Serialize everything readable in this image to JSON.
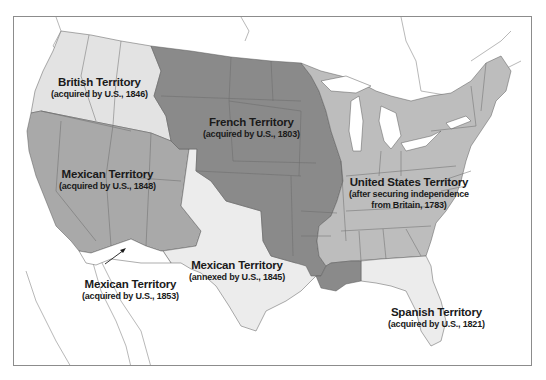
{
  "map": {
    "title": "Territorial acquisitions of the United States",
    "colors": {
      "background": "#ffffff",
      "frame": "#8c8c8c",
      "british": "#e3e3e3",
      "mexican_1848": "#a9a9a9",
      "french": "#8a8a8a",
      "united_states": "#bdbdbd",
      "texas": "#ececec",
      "spanish": "#ececec",
      "gadsden": "#ffffff",
      "borders": "#5a5a5a",
      "water_lines": "#9a9a9a"
    },
    "regions": [
      {
        "id": "british",
        "title": "British Territory",
        "subtitle": "(acquired by U.S., 1846)"
      },
      {
        "id": "french",
        "title": "French Territory",
        "subtitle": "(acquired by U.S., 1803)"
      },
      {
        "id": "mexican-1848",
        "title": "Mexican Territory",
        "subtitle": "(acquired by U.S., 1848)"
      },
      {
        "id": "united-states",
        "title": "United States Territory",
        "subtitle": "(after securing independence",
        "subtitle2": "from Britain, 1783)"
      },
      {
        "id": "texas",
        "title": "Mexican Territory",
        "subtitle": "(annexed by U.S., 1845)"
      },
      {
        "id": "gadsden",
        "title": "Mexican Territory",
        "subtitle": "(acquired by U.S., 1853)"
      },
      {
        "id": "spanish",
        "title": "Spanish Territory",
        "subtitle": "(acquired by U.S., 1821)"
      }
    ]
  }
}
